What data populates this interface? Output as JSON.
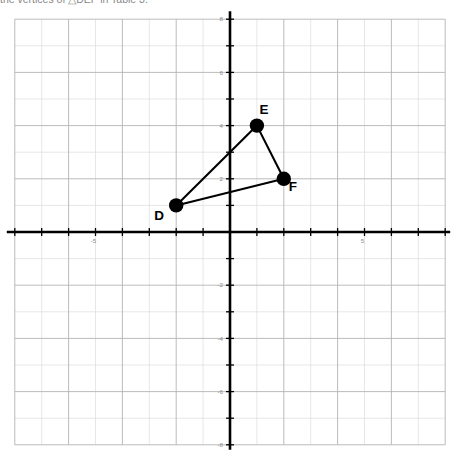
{
  "prompt": {
    "text": "the vertices of △DEF in Table 3."
  },
  "graph": {
    "background_color": "#ffffff",
    "grid_minor_color": "#dcdcdc",
    "grid_major_color": "#b4b4b4",
    "axis_color": "#000000",
    "point_color": "#000000",
    "segment_color": "#000000",
    "tick_label_color": "#8a8a8a",
    "x_tick_labels": [
      {
        "value": -5,
        "text": "-5"
      },
      {
        "value": 5,
        "text": "5"
      }
    ],
    "y_tick_labels": [
      {
        "value": 8,
        "text": "8"
      },
      {
        "value": 6,
        "text": "6"
      },
      {
        "value": 4,
        "text": "4"
      },
      {
        "value": 2,
        "text": "2"
      },
      {
        "value": -2,
        "text": "-2"
      },
      {
        "value": -4,
        "text": "-4"
      },
      {
        "value": -6,
        "text": "-6"
      },
      {
        "value": -8,
        "text": "-8"
      }
    ]
  },
  "chart_data": {
    "type": "scatter",
    "title": "",
    "xlabel": "",
    "ylabel": "",
    "xlim": [
      -8,
      8
    ],
    "ylim": [
      -8,
      8
    ],
    "grid": true,
    "legend": "none",
    "x_tick_step": 1,
    "y_tick_step": 1,
    "labeled_x_ticks": [
      -5,
      5
    ],
    "labeled_y_ticks": [
      8,
      6,
      4,
      2,
      -2,
      -4,
      -6,
      -8
    ],
    "shape": "triangle",
    "shape_name": "DEF",
    "points": [
      {
        "name": "D",
        "x": -2,
        "y": 1,
        "label_dx": -17,
        "label_dy": 15
      },
      {
        "name": "E",
        "x": 1,
        "y": 4,
        "label_dx": 7,
        "label_dy": -12
      },
      {
        "name": "F",
        "x": 2,
        "y": 2,
        "label_dx": 9,
        "label_dy": 12
      }
    ],
    "edges": [
      {
        "from": "D",
        "to": "E"
      },
      {
        "from": "E",
        "to": "F"
      },
      {
        "from": "F",
        "to": "D"
      }
    ]
  }
}
